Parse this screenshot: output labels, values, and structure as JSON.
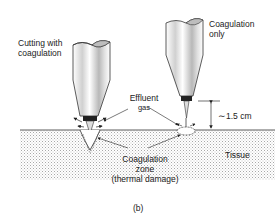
{
  "figure": {
    "panel_label": "(b)",
    "labels": {
      "cutting_line1": "Cutting with",
      "cutting_line2": "coagulation",
      "coag_only_line1": "Coagulation",
      "coag_only_line2": "only",
      "effluent_line1": "Effluent",
      "effluent_line2": "gas",
      "zone_line1": "Coagulation",
      "zone_line2": "zone",
      "zone_line3": "(thermal damage)",
      "distance": "∼1.5 cm",
      "tissue": "Tissue"
    },
    "colors": {
      "ink": "#222222",
      "tissue_dots": "#9a9a9a",
      "electrode_shade": "#bdbdbd"
    }
  }
}
